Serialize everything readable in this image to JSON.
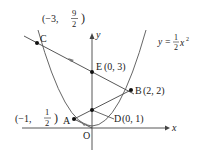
{
  "diagram": {
    "curve_label": {
      "prefix": "y =",
      "num": "1",
      "den": "2",
      "var": "x",
      "exp": "2"
    },
    "axes": {
      "x_label": "x",
      "y_label": "y",
      "origin_label": "O"
    },
    "points": {
      "A": {
        "name": "A",
        "coord_prefix": "(−1,",
        "num": "1",
        "den": "2",
        "coord_suffix": ")"
      },
      "B": {
        "name": "B",
        "coords": "(2,  2)"
      },
      "C": {
        "name": "C",
        "coord_prefix": "(−3,",
        "num": "9",
        "den": "2",
        "coord_suffix": ")"
      },
      "D": {
        "name": "D",
        "coords": "(0,  1)"
      },
      "E": {
        "name": "E",
        "coords": "(0,  3)"
      }
    },
    "colors": {
      "line": "#333333",
      "point": "#111111",
      "background": "#ffffff"
    }
  }
}
